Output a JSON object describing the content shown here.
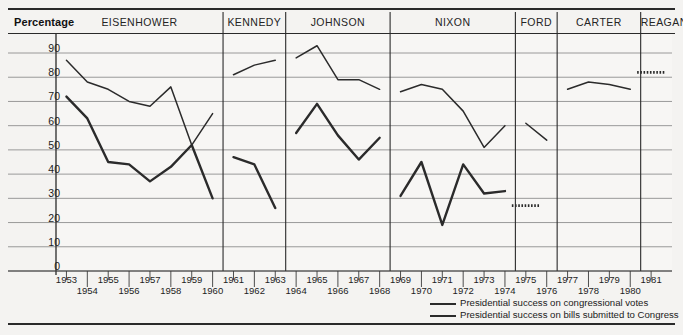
{
  "header": {
    "y_axis_title": "Percentage"
  },
  "presidents": [
    {
      "name": "EISENHOWER",
      "start_year": 1953,
      "end_year": 1960
    },
    {
      "name": "KENNEDY",
      "start_year": 1961,
      "end_year": 1963
    },
    {
      "name": "JOHNSON",
      "start_year": 1964,
      "end_year": 1968
    },
    {
      "name": "NIXON",
      "start_year": 1969,
      "end_year": 1974
    },
    {
      "name": "FORD",
      "start_year": 1975,
      "end_year": 1976
    },
    {
      "name": "CARTER",
      "start_year": 1977,
      "end_year": 1980
    },
    {
      "name": "REAGAN",
      "start_year": 1981,
      "end_year": 1982
    }
  ],
  "legend": {
    "items": [
      {
        "label": "Presidential success on congressional votes",
        "style": "thin",
        "color": "#2b2b2b"
      },
      {
        "label": "Presidential success on bills submitted to Congress",
        "style": "thick",
        "color": "#2b2b2b"
      }
    ]
  },
  "chart_data": {
    "type": "line",
    "title": "",
    "xlabel": "",
    "ylabel": "Percentage",
    "ylim": [
      0,
      95
    ],
    "yticks": [
      0,
      10,
      20,
      30,
      40,
      50,
      60,
      70,
      80,
      90
    ],
    "xlim": [
      1952.5,
      1982.5
    ],
    "xticks": [
      1953,
      1954,
      1955,
      1956,
      1957,
      1958,
      1959,
      1960,
      1961,
      1962,
      1963,
      1964,
      1965,
      1966,
      1967,
      1968,
      1969,
      1970,
      1971,
      1972,
      1973,
      1974,
      1975,
      1976,
      1977,
      1978,
      1979,
      1980,
      1981
    ],
    "xtick_rows": [
      "top",
      "bottom",
      "top",
      "bottom",
      "top",
      "bottom",
      "top",
      "bottom",
      "top",
      "bottom",
      "top",
      "bottom",
      "top",
      "bottom",
      "top",
      "bottom",
      "top",
      "bottom",
      "top",
      "bottom",
      "top",
      "bottom",
      "top",
      "bottom",
      "top",
      "bottom",
      "top",
      "bottom",
      "top"
    ],
    "grid": true,
    "legend_position": "bottom-right",
    "series": [
      {
        "name": "Presidential success on congressional votes",
        "color": "#2b2b2b",
        "width": 1.5,
        "segments": [
          {
            "president": "EISENHOWER",
            "x": [
              1953,
              1954,
              1955,
              1956,
              1957,
              1958,
              1959,
              1960
            ],
            "y": [
              87,
              78,
              75,
              70,
              68,
              76,
              52,
              65
            ]
          },
          {
            "president": "KENNEDY",
            "x": [
              1961,
              1962,
              1963
            ],
            "y": [
              81,
              85,
              87
            ]
          },
          {
            "president": "JOHNSON",
            "x": [
              1964,
              1965,
              1966,
              1967,
              1968
            ],
            "y": [
              88,
              93,
              79,
              79,
              75
            ]
          },
          {
            "president": "NIXON",
            "x": [
              1969,
              1970,
              1971,
              1972,
              1973,
              1974
            ],
            "y": [
              74,
              77,
              75,
              66,
              51,
              60
            ]
          },
          {
            "president": "FORD",
            "x": [
              1975,
              1976
            ],
            "y": [
              61,
              54
            ]
          },
          {
            "president": "CARTER",
            "x": [
              1977,
              1978,
              1979,
              1980
            ],
            "y": [
              75,
              78,
              77,
              75
            ]
          },
          {
            "president": "REAGAN",
            "x": [
              1981
            ],
            "y": [
              82
            ],
            "dotted": true
          }
        ]
      },
      {
        "name": "Presidential success on bills submitted to Congress",
        "color": "#2b2b2b",
        "width": 2.4,
        "segments": [
          {
            "president": "EISENHOWER",
            "x": [
              1953,
              1954,
              1955,
              1956,
              1957,
              1958,
              1959,
              1960
            ],
            "y": [
              72,
              63,
              45,
              44,
              37,
              43,
              52,
              30
            ]
          },
          {
            "president": "KENNEDY",
            "x": [
              1961,
              1962,
              1963
            ],
            "y": [
              47,
              44,
              26
            ]
          },
          {
            "president": "JOHNSON",
            "x": [
              1964,
              1965,
              1966,
              1967,
              1968
            ],
            "y": [
              57,
              69,
              56,
              46,
              55
            ]
          },
          {
            "president": "NIXON",
            "x": [
              1969,
              1970,
              1971,
              1972,
              1973,
              1974
            ],
            "y": [
              31,
              45,
              19,
              44,
              32,
              33
            ]
          },
          {
            "president": "FORD",
            "x": [
              1975
            ],
            "y": [
              27
            ]
          }
        ]
      }
    ]
  }
}
